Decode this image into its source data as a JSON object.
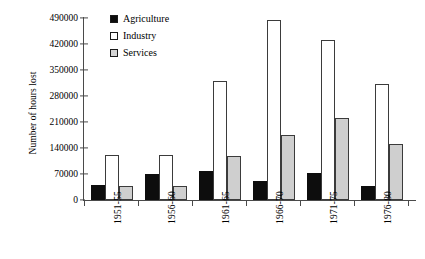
{
  "chart_data": {
    "type": "bar",
    "title": "",
    "xlabel": "",
    "ylabel": "Number of hours lost",
    "categories": [
      "1951-55",
      "1956-60",
      "1961-65",
      "1966-70",
      "1971-75",
      "1976-80"
    ],
    "series": [
      {
        "name": "Agriculture",
        "color": "#0d0d0d",
        "values": [
          40000,
          70000,
          78000,
          50000,
          72000,
          38000
        ]
      },
      {
        "name": "Industry",
        "color": "#ffffff",
        "values": [
          120000,
          121000,
          320000,
          485000,
          432000,
          313000
        ]
      },
      {
        "name": "Services",
        "color": "#cfcfcf",
        "values": [
          38000,
          38000,
          118000,
          175000,
          220000,
          152000
        ]
      }
    ],
    "ylim": [
      0,
      490000
    ],
    "yticks": [
      0,
      70000,
      140000,
      210000,
      280000,
      350000,
      420000,
      490000
    ],
    "ytick_labels": [
      "0",
      "70000",
      "140000",
      "210000",
      "280000",
      "350000",
      "420000",
      "490000"
    ],
    "grid": false,
    "legend_position": "top-left-inside"
  },
  "legend": {
    "items": [
      {
        "label": "Agriculture"
      },
      {
        "label": "Industry"
      },
      {
        "label": "Services"
      }
    ]
  }
}
